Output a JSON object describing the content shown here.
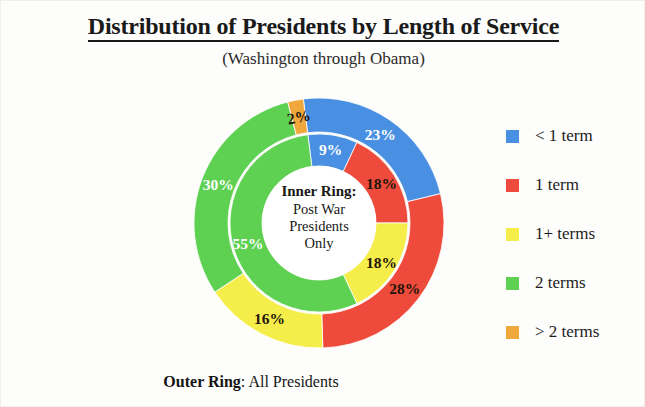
{
  "header": {
    "title": "Distribution of Presidents by Length of Service",
    "subtitle": "(Washington through Obama)"
  },
  "center_note": {
    "heading": "Inner Ring:",
    "line1": "Post War",
    "line2": "Presidents",
    "line3": "Only"
  },
  "bottom_caption": {
    "strong": "Outer Ring",
    "rest": ": All Presidents"
  },
  "legend": {
    "items": [
      {
        "label": "< 1 term",
        "color": "#4a90e2"
      },
      {
        "label": "1 term",
        "color": "#ee4b3c"
      },
      {
        "label": "1+ terms",
        "color": "#f5ee4a"
      },
      {
        "label": "2 terms",
        "color": "#5ed052"
      },
      {
        "label": "> 2 terms",
        "color": "#f0a83c"
      }
    ]
  },
  "chart_data": {
    "type": "pie",
    "title": "Distribution of Presidents by Length of Service",
    "subtitle": "(Washington through Obama)",
    "legend_position": "right",
    "categories": [
      "< 1 term",
      "1 term",
      "1+ terms",
      "2 terms",
      "> 2 terms"
    ],
    "colors": [
      "#4a90e2",
      "#ee4b3c",
      "#f5ee4a",
      "#5ed052",
      "#f0a83c"
    ],
    "series": [
      {
        "name": "Outer Ring: All Presidents",
        "ring": "outer",
        "values": [
          23,
          28,
          16,
          30,
          2
        ],
        "labels": [
          "23%",
          "28%",
          "16%",
          "30%",
          "2%"
        ],
        "label_colors": [
          "light",
          "dark",
          "dark",
          "light",
          "dark"
        ]
      },
      {
        "name": "Inner Ring: Post War Presidents Only",
        "ring": "inner",
        "values": [
          9,
          18,
          18,
          55,
          0
        ],
        "labels": [
          "9%",
          "18%",
          "18%",
          "55%",
          ""
        ],
        "label_colors": [
          "light",
          "dark",
          "dark",
          "light",
          "dark"
        ]
      }
    ],
    "geometry": {
      "center_x": 130,
      "center_y": 130,
      "outer_radius": 125,
      "ring_split_radius": 91,
      "hole_radius": 57,
      "start_angle_deg": -7.2
    }
  }
}
